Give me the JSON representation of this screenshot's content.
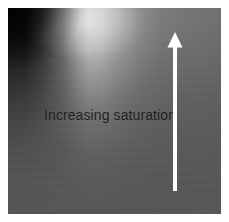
{
  "figure": {
    "type": "saturation-gradient-swatch",
    "width": 229,
    "height": 222,
    "background_color": "#ffffff",
    "margin_px": 8
  },
  "gradient": {
    "name": "grayscale-saturation-field",
    "colorspace": "grayscale",
    "darkest_color": "#000000",
    "highlight_color": "#d6d6d6",
    "base_color": "#757575",
    "bottom_color": "#565656",
    "description": "Grayscale field, near-black at the upper left, a bright bloom across the upper centre-left, flattening to a uniform mid gray toward the bottom."
  },
  "annotation": {
    "label": "Increasing saturation",
    "text_color": "#1d1d1d"
  },
  "arrow": {
    "name": "increasing-saturation-arrow",
    "direction": "up",
    "color": "#ffffff",
    "tip_x": 175,
    "tip_y": 38,
    "tail_y": 191,
    "shaft_width_px": 3,
    "head_width_px": 13,
    "head_height_px": 14
  }
}
